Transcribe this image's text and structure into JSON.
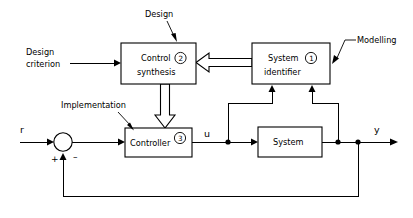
{
  "diagram": {
    "blocks": [
      {
        "id": "control-synthesis",
        "line1": "Control",
        "line2": "synthesis",
        "index": "2"
      },
      {
        "id": "system-identifier",
        "line1": "System",
        "line2": "identifier",
        "index": "1"
      },
      {
        "id": "controller",
        "line1": "Controller",
        "line2": "",
        "index": "3"
      },
      {
        "id": "system",
        "line1": "System",
        "line2": "",
        "index": ""
      }
    ],
    "annotations": [
      {
        "id": "design",
        "text": "Design"
      },
      {
        "id": "modelling",
        "text": "Modelling"
      },
      {
        "id": "implementation",
        "text": "Implementation"
      }
    ],
    "inputs": [
      {
        "id": "design-criterion",
        "line1": "Design",
        "line2": "criterion"
      }
    ],
    "signals": [
      {
        "id": "reference",
        "label": "r"
      },
      {
        "id": "control-signal",
        "label": "u"
      },
      {
        "id": "output",
        "label": "y"
      }
    ],
    "summing_junction": {
      "id": "summing-junction",
      "positive_sign": "+",
      "negative_sign": "–"
    },
    "colors": {
      "stroke": "#000000",
      "background": "#ffffff",
      "fill": "#ffffff"
    }
  }
}
